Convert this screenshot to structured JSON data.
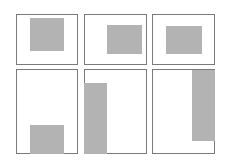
{
  "diagram": {
    "colors": {
      "frame_border": "#7a7a7a",
      "fill": "#b3b3b3",
      "background": "#ffffff"
    },
    "panels": [
      {
        "frame": [
          16,
          14,
          62,
          51
        ],
        "fill": [
          30,
          18,
          34,
          33
        ]
      },
      {
        "frame": [
          84,
          14,
          63,
          51
        ],
        "fill": [
          107,
          25,
          35,
          29
        ]
      },
      {
        "frame": [
          152,
          14,
          63,
          51
        ],
        "fill": [
          166,
          26,
          36,
          28
        ]
      },
      {
        "frame": [
          16,
          69,
          62,
          85
        ],
        "fill": [
          30,
          125,
          34,
          29
        ]
      },
      {
        "frame": [
          84,
          69,
          63,
          85
        ],
        "fill": [
          84,
          83,
          23,
          71
        ]
      },
      {
        "frame": [
          152,
          69,
          63,
          85
        ],
        "fill": [
          192,
          70,
          23,
          71
        ]
      }
    ]
  }
}
